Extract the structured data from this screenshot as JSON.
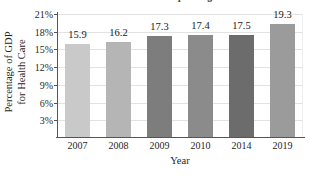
{
  "chart_data": {
    "type": "bar",
    "title": "U.S. Health Care Spending",
    "title_cropped": true,
    "categories": [
      "2007",
      "2008",
      "2009",
      "2010",
      "2014",
      "2019"
    ],
    "values": [
      15.9,
      16.2,
      17.3,
      17.4,
      17.5,
      19.3
    ],
    "data_labels": [
      "15.9",
      "16.2",
      "17.3",
      "17.4",
      "17.5",
      "19.3"
    ],
    "xlabel": "Year",
    "ylabel_line1": "Percentage of GDP",
    "ylabel_line2": "for Health Care",
    "ylabel": "Percentage of GDP for Health Care",
    "ylim": [
      0,
      21
    ],
    "ytick_values": [
      3,
      6,
      9,
      12,
      15,
      18,
      21
    ],
    "ytick_labels": [
      "3%",
      "6%",
      "9%",
      "12%",
      "15%",
      "18%",
      "21%"
    ],
    "grid": true,
    "legend": "none",
    "bar_colors": [
      "#c9c9c9",
      "#b5b5b5",
      "#7d7d7d",
      "#8b8b8b",
      "#6c6c6c",
      "#9b9b9b"
    ],
    "axis_color": "#555555",
    "gridline_color": "#e2e2e2",
    "background_color": "#ffffff"
  }
}
